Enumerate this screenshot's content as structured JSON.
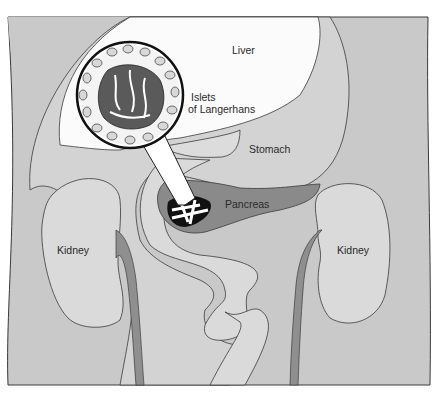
{
  "diagram": {
    "labels": {
      "liver": "Liver",
      "islets_line1": "Islets",
      "islets_line2": "of Langerhans",
      "stomach": "Stomach",
      "pancreas": "Pancreas",
      "kidney_left": "Kidney",
      "kidney_right": "Kidney"
    },
    "colors": {
      "body": "#c9c9c9",
      "liver": "#fbfbfb",
      "stomach": "#dcdcdc",
      "pancreas": "#8a8a8a",
      "kidney": "#dadada",
      "vessel": "#8f8f8f",
      "outline": "#3a3a3a"
    }
  }
}
